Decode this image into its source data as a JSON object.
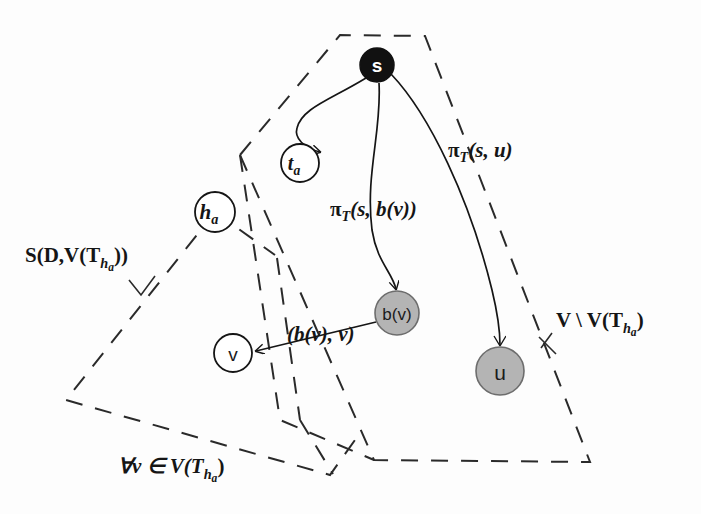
{
  "figure": {
    "background_color": "#fdfdfd",
    "ink_color": "#151515"
  },
  "nodes": [
    {
      "id": "s",
      "label": "s",
      "x": 377,
      "y": 65,
      "r": 17,
      "fill": "#111111",
      "text_color": "#ffffff",
      "style": "filled-black"
    },
    {
      "id": "t_a",
      "label": "t",
      "sub": "a",
      "x": 300,
      "y": 163,
      "r": 19,
      "fill": "#ffffff",
      "text_color": "#151515",
      "style": "outline"
    },
    {
      "id": "h_a",
      "label": "h",
      "sub": "a",
      "x": 215,
      "y": 212,
      "r": 20,
      "fill": "#ffffff",
      "text_color": "#151515",
      "style": "outline"
    },
    {
      "id": "b_v",
      "label": "b(v)",
      "x": 397,
      "y": 313,
      "r": 22,
      "fill": "#b4b4b4",
      "text_color": "#2a2a2a",
      "style": "filled-gray"
    },
    {
      "id": "v",
      "label": "v",
      "x": 233,
      "y": 353,
      "r": 19,
      "fill": "#ffffff",
      "text_color": "#151515",
      "style": "outline"
    },
    {
      "id": "u",
      "label": "u",
      "x": 500,
      "y": 371,
      "r": 24,
      "fill": "#b4b4b4",
      "text_color": "#2a2a2a",
      "style": "filled-gray"
    }
  ],
  "edges": [
    {
      "id": "s-to-ta",
      "from": "s",
      "to": "t_a",
      "label": "",
      "kind": "curved-arrow"
    },
    {
      "id": "s-to-bv",
      "from": "s",
      "to": "b_v",
      "label": "π",
      "label_sub": "T",
      "label_rest": "(s, b(v))",
      "label_x": 330,
      "label_y": 216,
      "kind": "curved-arrow"
    },
    {
      "id": "s-to-u",
      "from": "s",
      "to": "u",
      "label": "π",
      "label_sub": "T",
      "label_rest": "(s, u)",
      "label_x": 448,
      "label_y": 157,
      "kind": "curved-arrow"
    },
    {
      "id": "bv-to-v",
      "from": "b_v",
      "to": "v",
      "label": "(b(v), v)",
      "label_x": 287,
      "label_y": 341,
      "kind": "straight-arrow"
    }
  ],
  "regions": [
    {
      "id": "left-region",
      "label_main": "S(D,V(T",
      "label_sub": "h",
      "label_subsub": "a",
      "label_tail": "))",
      "label_x": 25,
      "label_y": 262,
      "style": "dashed-polygon"
    },
    {
      "id": "right-region",
      "label_main": "V \\ V(T",
      "label_sub": "h",
      "label_subsub": "a",
      "label_tail": ")",
      "label_x": 556,
      "label_y": 327,
      "style": "dashed-polygon"
    }
  ],
  "annotations": [
    {
      "id": "forall-caption",
      "text_quant": "∀v ∈ V(T",
      "text_sub": "h",
      "text_subsub": "a",
      "text_tail": ")",
      "x": 118,
      "y": 473
    }
  ],
  "math_symbols": {
    "pi": "π",
    "forall": "∀",
    "element_of": "∈",
    "setminus": "\\"
  }
}
